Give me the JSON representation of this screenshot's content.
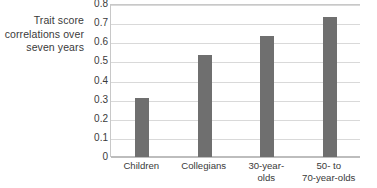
{
  "chart_data": {
    "type": "bar",
    "title": "",
    "subtitle": "",
    "xlabel": "",
    "ylabel": "Trait score correlations over seven years",
    "ylabel_lines": [
      "Trait score",
      "correlations over",
      "seven years"
    ],
    "categories": [
      "Children",
      "Collegians",
      "30-year-olds",
      "50- to 70-year-olds"
    ],
    "category_lines": [
      [
        "Children"
      ],
      [
        "Collegians"
      ],
      [
        "30-year-",
        "olds"
      ],
      [
        "50-  to",
        "70-year-olds"
      ]
    ],
    "values": [
      0.31,
      0.535,
      0.635,
      0.73
    ],
    "ylim": [
      0,
      0.8
    ],
    "y_ticks": [
      0.8,
      0.7,
      0.6,
      0.5,
      0.4,
      0.3,
      0.2,
      0.1,
      0
    ],
    "y_tick_labels": [
      "0.8",
      "0.7",
      "0.6",
      "0.5",
      "0.4",
      "0.3",
      "0.2",
      "0.1",
      "0"
    ],
    "grid": true,
    "grid_orientation": "horizontal",
    "legend": false,
    "legend_position": "none",
    "bar_color": "#6f6f6f",
    "gridline_color": "#d9d9d9",
    "axis_color": "#c8c8c8",
    "background_color": "#ffffff",
    "text_color": "#3a3a3a"
  }
}
